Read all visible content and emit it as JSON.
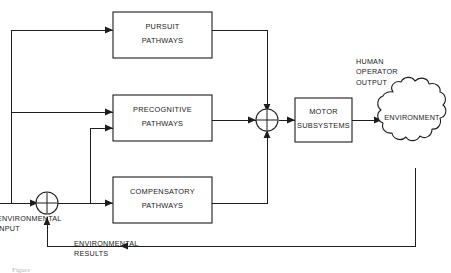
{
  "figure": {
    "background_color": "#ffffff",
    "line_color": "#1d1d1d",
    "text_color": "#1a1a1a"
  },
  "blocks": [
    {
      "id": "pursuit",
      "line1": "PURSUIT",
      "line2": "PATHWAYS"
    },
    {
      "id": "precognitive",
      "line1": "PRECOGNITIVE",
      "line2": "PATHWAYS"
    },
    {
      "id": "compensatory",
      "line1": "COMPENSATORY",
      "line2": "PATHWAYS"
    },
    {
      "id": "motor",
      "line1": "MOTOR",
      "line2": "SUBSYSTEMS"
    }
  ],
  "environment": {
    "label": "ENVIRONMENT"
  },
  "labels": {
    "human_operator_output": {
      "line1": "HUMAN",
      "line2": "OPERATOR",
      "line3": "OUTPUT"
    },
    "environmental_input": {
      "line1": "ENVIRONMENTAL",
      "line2": "INPUT"
    },
    "environmental_results": {
      "line1": "ENVIRONMENTAL",
      "line2": "RESULTS"
    }
  },
  "junctions": [
    {
      "id": "input-sum",
      "symbol": "+"
    },
    {
      "id": "output-sum",
      "symbol": "+"
    }
  ],
  "caption": {
    "text": "Figure"
  }
}
